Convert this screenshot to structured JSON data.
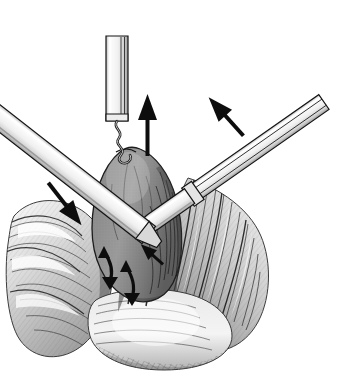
{
  "figure": {
    "domain": "medical-surgical-illustration",
    "title": "Laparoscopic retraction and blunt dissection of an organ",
    "style": "pen-and-ink grayscale line drawing with stipple and cross-hatch shading",
    "width": 344,
    "height": 382,
    "background_color": "#ffffff",
    "has_text_labels": false,
    "caption": ""
  },
  "palette": {
    "background": "#ffffff",
    "ink_black": "#111111",
    "outline": "#2b2b2b",
    "organ_fill": "#8d8d8d",
    "organ_shadow": "#5e5e5e",
    "organ_highlight": "#a9a9a9",
    "tissue_light": "#e8e8e8",
    "tissue_mid": "#b4b4b4",
    "tissue_dark": "#6a6a6a",
    "instrument_fill": "#f2f2f2",
    "instrument_shade": "#c9c9c9",
    "instrument_edge": "#1a1a1a",
    "arrow_fill": "#0d0d0d"
  },
  "elements": {
    "vertical_cannula": {
      "name": "vertical cannula with corkscrew tip",
      "position": "top center",
      "angle_degrees": 92,
      "tip_type": "helical corkscrew / spiral hook",
      "action": "grasps and lifts the organ upward"
    },
    "right_instrument": {
      "name": "blunt dissector shaft",
      "position": "upper right",
      "angle_degrees": 35,
      "tip_type": "rounded blunt tip with collar joint",
      "action": "blunt dissection at the organ base"
    },
    "left_instrument": {
      "name": "retractor shaft",
      "position": "upper left to center",
      "angle_degrees": -38,
      "tip_type": "tapered shaft",
      "action": "sweeps tissue down and to the right"
    },
    "organ": {
      "name": "central ovoid organ",
      "shape": "pear-shaped / ovoid mass",
      "surface": "smooth with visible surface vessels",
      "position": "center, elevated by the corkscrew"
    },
    "surrounding_tissue": {
      "name": "fibrous tissue flaps and fascial planes",
      "position": "lower left, lower right, and base",
      "texture": "striated fibers with dense hatching"
    }
  },
  "arrows": [
    {
      "id": "arrow-up",
      "label": "traction upward",
      "direction": "up",
      "angle_degrees": 90,
      "x": 148,
      "y": 110,
      "length": 56,
      "style": "straight solid"
    },
    {
      "id": "arrow-upright",
      "label": "instrument advance up and right",
      "direction": "up-right",
      "angle_degrees": 42,
      "x": 222,
      "y": 112,
      "length": 40,
      "style": "straight solid"
    },
    {
      "id": "arrow-downright",
      "label": "sweep down and right along shaft",
      "direction": "down-right",
      "angle_degrees": -38,
      "x": 66,
      "y": 212,
      "length": 48,
      "style": "straight solid"
    },
    {
      "id": "arrow-curved-a",
      "label": "tissue plane separation",
      "direction": "curved bidirectional",
      "x": 108,
      "y": 262,
      "style": "curved hooked"
    },
    {
      "id": "arrow-curved-b",
      "label": "tissue plane separation",
      "direction": "curved bidirectional",
      "x": 128,
      "y": 278,
      "style": "curved hooked"
    }
  ]
}
